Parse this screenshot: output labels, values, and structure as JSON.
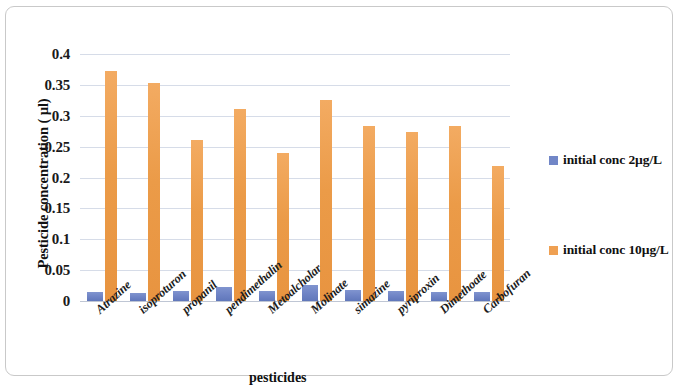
{
  "chart_data": {
    "type": "bar",
    "title": "",
    "xlabel": "pesticides",
    "ylabel": "Pesticide concentration ( µl)",
    "ylim": [
      0,
      0.4
    ],
    "ytick_labels": [
      "0.4",
      "0.35",
      "0.3",
      "0.25",
      "0.2",
      "0.15",
      "0.1",
      "0.05",
      "0"
    ],
    "ytick_values": [
      0.4,
      0.35,
      0.3,
      0.25,
      0.2,
      0.15,
      0.1,
      0.05,
      0
    ],
    "grid": true,
    "legend_position": "right",
    "categories": [
      "Atrazine",
      "isoproturon",
      "propanil",
      "pendimethalin",
      "Metoalcholar",
      "Molinate",
      "simazine",
      "pyriproxin",
      "Dimethoate",
      "Carbofuran"
    ],
    "series": [
      {
        "name": "initial conc 2µg/L",
        "color": "#7186c7",
        "values": [
          0.015,
          0.013,
          0.017,
          0.023,
          0.016,
          0.026,
          0.018,
          0.016,
          0.015,
          0.015
        ]
      },
      {
        "name": "initial conc 10µg/L",
        "color": "#efa052",
        "values": [
          0.372,
          0.353,
          0.261,
          0.311,
          0.239,
          0.325,
          0.284,
          0.274,
          0.283,
          0.219
        ]
      }
    ]
  },
  "legend": {
    "entries": [
      {
        "label": "initial conc 2µg/L",
        "color": "#7186c7"
      },
      {
        "label": "initial conc 10µg/L",
        "color": "#efa052"
      }
    ]
  }
}
